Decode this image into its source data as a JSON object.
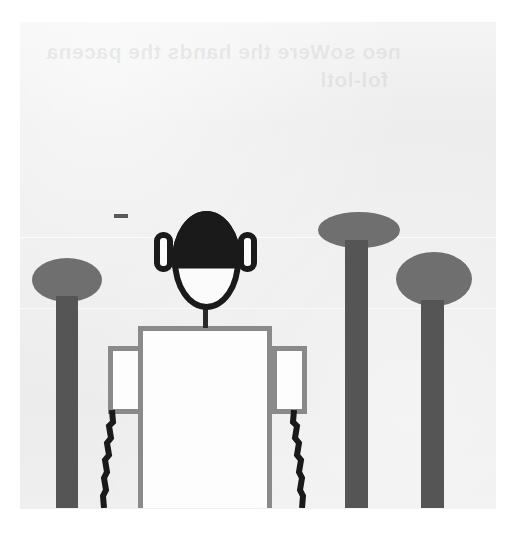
{
  "image": {
    "title": "Scanned hand-drawn figure with posts",
    "width": 523,
    "height": 539,
    "background_color": "#ffffff",
    "paper_color": "#ececec"
  },
  "ghost_text": {
    "note": "Faint bleed-through text from the reverse side of the page, mirrored and barely legible",
    "line_1": "neo soWere the hands the pacena",
    "line_2": "fol-lotl"
  },
  "drawing": {
    "subject": "front-facing stick/outline person standing among three capped posts",
    "ink_colors": {
      "hair": "#1a1a1a",
      "outline": "#1a1a1a",
      "body_outline": "#8a8a8a",
      "post_cap": "#6f6f6f",
      "post_shaft": "#555555",
      "fill": "#fdfdfd"
    },
    "figure": {
      "label": "person",
      "head": {
        "label": "head",
        "shape": "oval",
        "x": 172,
        "y": 211,
        "width": 69,
        "height": 99
      },
      "hair": {
        "label": "hair",
        "coverage": "top half of head"
      },
      "ear_left": {
        "label": "left ear",
        "x": 154,
        "y": 232,
        "width": 19,
        "height": 40
      },
      "ear_right": {
        "label": "right ear",
        "x": 238,
        "y": 232,
        "width": 19,
        "height": 40
      },
      "neck": {
        "label": "neck",
        "x": 203,
        "y": 306,
        "width": 5,
        "height": 22
      },
      "torso": {
        "label": "torso",
        "x": 138,
        "y": 326,
        "width": 134,
        "height": 182
      },
      "sleeve_left": {
        "label": "left sleeve",
        "x": 108,
        "y": 346,
        "width": 35,
        "height": 68
      },
      "sleeve_right": {
        "label": "right sleeve",
        "x": 272,
        "y": 346,
        "width": 35,
        "height": 68
      },
      "arm_left": {
        "label": "left arm",
        "style": "dark zig-zag line"
      },
      "arm_right": {
        "label": "right arm",
        "style": "dark zig-zag line"
      }
    },
    "posts": [
      {
        "label": "left post",
        "cap_x": 32,
        "cap_y": 258,
        "cap_w": 70,
        "cap_h": 44,
        "shaft_x": 56,
        "shaft_y": 296,
        "shaft_w": 22,
        "shaft_h": 212
      },
      {
        "label": "middle right post",
        "cap_x": 318,
        "cap_y": 212,
        "cap_w": 82,
        "cap_h": 36,
        "shaft_x": 345,
        "shaft_y": 240,
        "shaft_w": 23,
        "shaft_h": 268
      },
      {
        "label": "right post",
        "cap_x": 396,
        "cap_y": 252,
        "cap_w": 76,
        "cap_h": 54,
        "shaft_x": 421,
        "shaft_y": 300,
        "shaft_w": 23,
        "shaft_h": 208
      }
    ],
    "marks": [
      {
        "label": "stray ink dash",
        "x": 114,
        "y": 214,
        "width": 14,
        "height": 4
      }
    ],
    "scan_seams": [
      237,
      308
    ]
  }
}
